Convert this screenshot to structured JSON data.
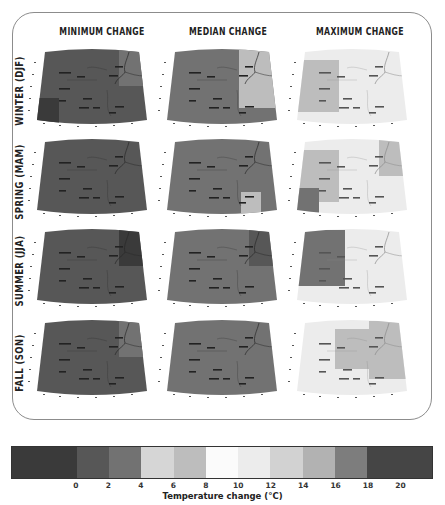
{
  "chart_data": {
    "type": "heatmap",
    "columns": [
      "MINIMUM CHANGE",
      "MEDIAN CHANGE",
      "MAXIMUM CHANGE"
    ],
    "rows": [
      "WINTER (DJF)",
      "SPRING (MAM)",
      "SUMMER (JJA)",
      "FALL (SON)"
    ],
    "colorbar": {
      "label": "Temperature change (°C)",
      "ticks": [
        "0",
        "2",
        "4",
        "6",
        "8",
        "10",
        "12",
        "14",
        "16",
        "18",
        "20"
      ],
      "bins": [
        {
          "range": "<0",
          "color": "#3a3a3a"
        },
        {
          "range": "0-2",
          "color": "#575757"
        },
        {
          "range": "2-4",
          "color": "#727272"
        },
        {
          "range": "4-6",
          "color": "#d6d6d6"
        },
        {
          "range": "6-8",
          "color": "#bdbdbd"
        },
        {
          "range": "8-10",
          "color": "#fbfbfb"
        },
        {
          "range": "10-12",
          "color": "#ececec"
        },
        {
          "range": "12-14",
          "color": "#d2d2d2"
        },
        {
          "range": "14-16",
          "color": "#b2b2b2"
        },
        {
          "range": "16-18",
          "color": "#7d7d7d"
        },
        {
          "range": ">18",
          "color": "#454545"
        }
      ]
    },
    "panels": [
      {
        "row": "WINTER (DJF)",
        "col": "MINIMUM CHANGE",
        "base_bin": "0-2",
        "patches": [
          {
            "pos": "northeast",
            "bin": "2-4"
          },
          {
            "pos": "southwest",
            "bin": "<0"
          }
        ]
      },
      {
        "row": "WINTER (DJF)",
        "col": "MEDIAN CHANGE",
        "base_bin": "2-4",
        "patches": [
          {
            "pos": "east",
            "bin": "6-8"
          }
        ]
      },
      {
        "row": "WINTER (DJF)",
        "col": "MAXIMUM CHANGE",
        "base_bin": "10-12",
        "patches": [
          {
            "pos": "west",
            "bin": "6-8"
          }
        ]
      },
      {
        "row": "SPRING (MAM)",
        "col": "MINIMUM CHANGE",
        "base_bin": "0-2",
        "patches": []
      },
      {
        "row": "SPRING (MAM)",
        "col": "MEDIAN CHANGE",
        "base_bin": "2-4",
        "patches": [
          {
            "pos": "southeast",
            "bin": "6-8"
          }
        ]
      },
      {
        "row": "SPRING (MAM)",
        "col": "MAXIMUM CHANGE",
        "base_bin": "10-12",
        "patches": [
          {
            "pos": "west",
            "bin": "6-8"
          },
          {
            "pos": "northeast",
            "bin": "6-8"
          },
          {
            "pos": "southwest",
            "bin": "2-4"
          }
        ]
      },
      {
        "row": "SUMMER (JJA)",
        "col": "MINIMUM CHANGE",
        "base_bin": "0-2",
        "patches": [
          {
            "pos": "northeast",
            "bin": "<0"
          }
        ]
      },
      {
        "row": "SUMMER (JJA)",
        "col": "MEDIAN CHANGE",
        "base_bin": "2-4",
        "patches": [
          {
            "pos": "northeast",
            "bin": "0-2"
          }
        ]
      },
      {
        "row": "SUMMER (JJA)",
        "col": "MAXIMUM CHANGE",
        "base_bin": "10-12",
        "patches": [
          {
            "pos": "northwest",
            "bin": "2-4"
          }
        ]
      },
      {
        "row": "FALL (SON)",
        "col": "MINIMUM CHANGE",
        "base_bin": "0-2",
        "patches": [
          {
            "pos": "northeast",
            "bin": "2-4"
          }
        ]
      },
      {
        "row": "FALL (SON)",
        "col": "MEDIAN CHANGE",
        "base_bin": "2-4",
        "patches": []
      },
      {
        "row": "FALL (SON)",
        "col": "MAXIMUM CHANGE",
        "base_bin": "10-12",
        "patches": [
          {
            "pos": "center",
            "bin": "6-8"
          },
          {
            "pos": "east",
            "bin": "6-8"
          }
        ]
      }
    ]
  },
  "labels": {
    "col_min": "MINIMUM CHANGE",
    "col_med": "MEDIAN CHANGE",
    "col_max": "MAXIMUM CHANGE",
    "row_winter": "WINTER (DJF)",
    "row_spring": "SPRING (MAM)",
    "row_summer": "SUMMER (JJA)",
    "row_fall": "FALL (SON)",
    "colorbar_label": "Temperature change (°C)",
    "ticks": [
      "0",
      "2",
      "4",
      "6",
      "8",
      "10",
      "12",
      "14",
      "16",
      "18",
      "20"
    ]
  }
}
